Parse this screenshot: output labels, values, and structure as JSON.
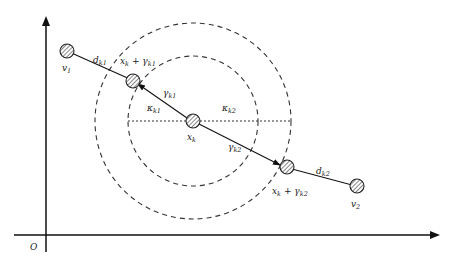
{
  "diagram": {
    "origin_label": "O",
    "nodes": [
      {
        "id": "v1",
        "label": "v",
        "sub": "1"
      },
      {
        "id": "xk_plus_gamma_k1",
        "label": "x",
        "sub": "k",
        "suffix": " + γ",
        "suffix_sub": "k1"
      },
      {
        "id": "xk",
        "label": "x",
        "sub": "k"
      },
      {
        "id": "xk_plus_gamma_k2",
        "label": "x",
        "sub": "k",
        "suffix": " + γ",
        "suffix_sub": "k2"
      },
      {
        "id": "v2",
        "label": "v",
        "sub": "2"
      }
    ],
    "edge_labels": {
      "d_k1": {
        "main": "d",
        "sub": "k1"
      },
      "gamma_k1": {
        "main": "γ",
        "sub": "k1"
      },
      "gamma_k2": {
        "main": "γ",
        "sub": "k2"
      },
      "d_k2": {
        "main": "d",
        "sub": "k2"
      },
      "kappa_k1": {
        "main": "κ",
        "sub": "k1"
      },
      "kappa_k2": {
        "main": "κ",
        "sub": "k2"
      }
    },
    "circles": [
      {
        "name": "inner-radius",
        "radius_px": 65
      },
      {
        "name": "outer-radius",
        "radius_px": 98
      }
    ],
    "colors": {
      "stroke": "#222222",
      "node_fill": "#ffffff",
      "hatch": "#444444"
    }
  }
}
